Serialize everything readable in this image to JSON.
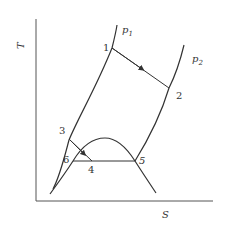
{
  "diagram": {
    "type": "T-S diagram (Rankine cycle)",
    "axes": {
      "x_label": "S",
      "y_label": "T"
    },
    "isobars": [
      {
        "name": "p1",
        "label": "p",
        "subscript": "1"
      },
      {
        "name": "p2",
        "label": "p",
        "subscript": "2"
      }
    ],
    "points": [
      {
        "id": "1",
        "label": "1"
      },
      {
        "id": "2",
        "label": "2"
      },
      {
        "id": "3",
        "label": "3"
      },
      {
        "id": "4",
        "label": "4"
      },
      {
        "id": "5",
        "label": "5"
      },
      {
        "id": "6",
        "label": "6"
      }
    ],
    "colors": {
      "line": "#333333",
      "background": "#ffffff"
    }
  }
}
